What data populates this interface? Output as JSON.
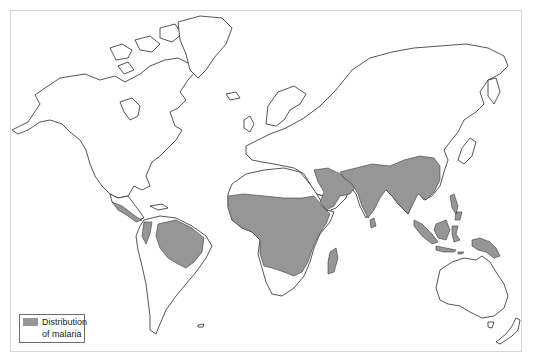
{
  "map": {
    "title": "World map - distribution of malaria",
    "colors": {
      "land_fill": "#ffffff",
      "coastline": "#2a2a2a",
      "malaria_fill": "#969696",
      "frame_border": "#d6d6d6"
    },
    "shaded_regions": [
      "Central America / southern Mexico",
      "Amazon basin (northern South America)",
      "Sub-Saharan Africa",
      "Madagascar",
      "Middle East / Arabian peninsula",
      "South Asia (India)",
      "Southeast Asia & southern China",
      "Indonesia / Philippines",
      "New Guinea"
    ]
  },
  "legend": {
    "label": "Distribution\nof malaria",
    "swatch_color": "#969696"
  }
}
